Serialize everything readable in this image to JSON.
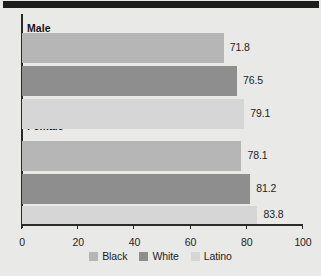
{
  "chart_data": {
    "type": "bar",
    "orientation": "horizontal",
    "title": "",
    "xlabel": "",
    "ylabel": "",
    "xlim": [
      0,
      100
    ],
    "xticks": [
      0,
      20,
      40,
      60,
      80,
      100
    ],
    "xtick_labels": [
      "0",
      "20",
      "40",
      "60",
      "80",
      "100"
    ],
    "grid": false,
    "legend_position": "bottom",
    "categories": [
      "Male",
      "Female"
    ],
    "series": [
      {
        "name": "Black",
        "color": "#b6b6b6",
        "values": [
          71.8,
          79.1
        ]
      },
      {
        "name": "White",
        "color": "#8e8e8e",
        "values": [
          76.5,
          81.2
        ]
      },
      {
        "name": "Latino",
        "color": "#d6d6d6",
        "values": [
          79.1,
          83.8
        ]
      }
    ],
    "bars": [
      {
        "group": "Male",
        "series": "Black",
        "value": 71.8,
        "label": "71.8",
        "color": "#b6b6b6"
      },
      {
        "group": "Male",
        "series": "White",
        "value": 76.5,
        "label": "76.5",
        "color": "#8e8e8e"
      },
      {
        "group": "Male",
        "series": "Latino",
        "value": 79.1,
        "label": "79.1",
        "color": "#d6d6d6"
      },
      {
        "group": "Female",
        "series": "Black",
        "value": 78.1,
        "label": "78.1",
        "color": "#b6b6b6"
      },
      {
        "group": "Female",
        "series": "White",
        "value": 81.2,
        "label": "81.2",
        "color": "#8e8e8e"
      },
      {
        "group": "Female",
        "series": "Latino",
        "value": 83.8,
        "label": "83.8",
        "color": "#d6d6d6"
      }
    ]
  },
  "groups": [
    {
      "label": "Male"
    },
    {
      "label": "Female"
    }
  ],
  "axis": {
    "ticks": [
      {
        "label": "0",
        "value": 0
      },
      {
        "label": "20",
        "value": 20
      },
      {
        "label": "40",
        "value": 40
      },
      {
        "label": "60",
        "value": 60
      },
      {
        "label": "80",
        "value": 80
      },
      {
        "label": "100",
        "value": 100
      }
    ]
  },
  "legend": {
    "items": [
      {
        "label": "Black",
        "color": "#b6b6b6"
      },
      {
        "label": "White",
        "color": "#8e8e8e"
      },
      {
        "label": "Latino",
        "color": "#d6d6d6"
      }
    ]
  },
  "colors": {
    "background": "#e9e9e7",
    "band": "#1c1c1c",
    "axis": "#2a2a2a",
    "text": "#1d1d1d"
  }
}
